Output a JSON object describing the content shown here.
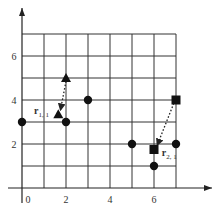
{
  "diagram": {
    "type": "grid-point-plot",
    "axes": {
      "x_ticks": [
        {
          "value": 0,
          "label": "0"
        },
        {
          "value": 2,
          "label": "2"
        },
        {
          "value": 4,
          "label": "4"
        },
        {
          "value": 6,
          "label": "6"
        }
      ],
      "y_ticks": [
        {
          "value": 2,
          "label": "2"
        },
        {
          "value": 4,
          "label": "4"
        },
        {
          "value": 6,
          "label": "6"
        }
      ],
      "grid": {
        "x_min": 0,
        "x_max": 7,
        "y_min": 0,
        "y_max": 7
      }
    },
    "circles": [
      {
        "x": 0,
        "y": 3
      },
      {
        "x": 2,
        "y": 3
      },
      {
        "x": 3,
        "y": 4
      },
      {
        "x": 5,
        "y": 2
      },
      {
        "x": 7,
        "y": 2
      },
      {
        "x": 6,
        "y": 1
      }
    ],
    "triangles": [
      {
        "x": 2,
        "y": 5
      },
      {
        "x": 1.65,
        "y": 3.35
      }
    ],
    "squares": [
      {
        "x": 7,
        "y": 4
      },
      {
        "x": 6,
        "y": 1.75
      }
    ],
    "arrows": [
      {
        "from": {
          "x": 2,
          "y": 4.85
        },
        "to": {
          "x": 1.75,
          "y": 3.55
        },
        "style": "dotted"
      },
      {
        "from": {
          "x": 6.9,
          "y": 3.85
        },
        "to": {
          "x": 6.15,
          "y": 1.95
        },
        "style": "dotted"
      }
    ],
    "labels": [
      {
        "id": "r11",
        "main": "r",
        "sub": "1, 1",
        "x": 0.55,
        "y": 3.35
      },
      {
        "id": "r21",
        "main": "r",
        "sub": "2, 1",
        "x": 6.35,
        "y": 1.45
      }
    ]
  }
}
